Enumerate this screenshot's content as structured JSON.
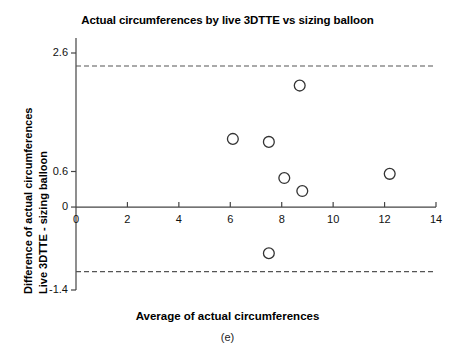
{
  "title": "Actual circumferences by live 3DTTE vs sizing balloon",
  "axes": {
    "y_label_line1": "Difference of actual circumferences",
    "y_label_line2": "Live 3DTTE - sizing balloon",
    "x_label": "Average of actual circumferences",
    "panel_label": "(e)"
  },
  "colors": {
    "axis": "#444444",
    "marker_stroke": "#333333",
    "limit_line": "#555555",
    "mean_line": "#444444",
    "background": "#ffffff"
  },
  "chart_data": {
    "type": "scatter",
    "title": "Actual circumferences by live 3DTTE vs sizing balloon",
    "xlabel": "Average of actual circumferences",
    "ylabel": "Difference of actual circumferences Live 3DTTE - sizing balloon",
    "xlim": [
      0,
      14
    ],
    "ylim": [
      -1.4,
      2.6
    ],
    "xticks": [
      0,
      2,
      4,
      6,
      8,
      10,
      12,
      14
    ],
    "xtick_labels": [
      "0",
      "2",
      "4",
      "6",
      "8",
      "10",
      "12",
      "14"
    ],
    "yticks": [
      2.6,
      0.6,
      0,
      -1.4
    ],
    "ytick_labels": [
      "2.6",
      "0.6",
      "0",
      "-1.4"
    ],
    "grid": false,
    "legend": "none",
    "points": [
      {
        "x": 6.1,
        "y": 1.15
      },
      {
        "x": 7.5,
        "y": 1.1
      },
      {
        "x": 8.7,
        "y": 2.05
      },
      {
        "x": 8.1,
        "y": 0.49
      },
      {
        "x": 8.8,
        "y": 0.27
      },
      {
        "x": 12.2,
        "y": 0.56
      },
      {
        "x": 7.5,
        "y": -0.78
      }
    ],
    "reference_lines": [
      {
        "name": "upper-limit-of-agreement",
        "y": 2.38,
        "style": "dashed"
      },
      {
        "name": "mean-difference",
        "y": 0.0,
        "style": "solid"
      },
      {
        "name": "lower-limit-of-agreement",
        "y": -1.09,
        "style": "dashed"
      }
    ]
  }
}
